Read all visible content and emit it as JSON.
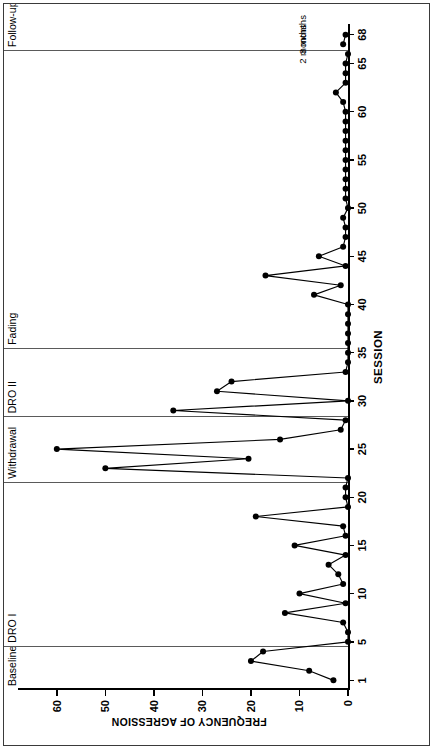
{
  "figure": {
    "kind": "single-case-design-graph",
    "has_outer_border": true,
    "orientation_note": "printed-sideways"
  },
  "chart_data": {
    "type": "line",
    "title": "",
    "xlabel": "SESSION",
    "ylabel": "FREQUENCY OF AGRESSION",
    "xlim": [
      0,
      69
    ],
    "ylim": [
      0,
      68
    ],
    "xticks": [
      1,
      5,
      10,
      15,
      20,
      25,
      30,
      35,
      40,
      45,
      50,
      55,
      60,
      65,
      68
    ],
    "yticks": [
      0,
      10,
      20,
      30,
      40,
      50,
      60
    ],
    "grid": false,
    "legend": "none",
    "marker": "filled-circle",
    "line_color": "#000000",
    "series": [
      {
        "name": "Frequency of aggression",
        "x": [
          1,
          2,
          3,
          4,
          5,
          6,
          7,
          8,
          9,
          10,
          11,
          12,
          13,
          14,
          15,
          16,
          17,
          18,
          19,
          20,
          21,
          22,
          23,
          24,
          25,
          26,
          27,
          28,
          29,
          30,
          31,
          32,
          33,
          34,
          35,
          36,
          37,
          38,
          39,
          40,
          41,
          42,
          43,
          44,
          45,
          46,
          47,
          48,
          49,
          50,
          51,
          52,
          53,
          54,
          55,
          56,
          57,
          58,
          59,
          60,
          61,
          62,
          63,
          64,
          65,
          66,
          67,
          68
        ],
        "y": [
          3,
          8,
          20,
          17.5,
          0,
          0,
          1,
          13,
          0.5,
          10,
          1,
          2,
          4,
          0.5,
          11,
          0.5,
          1,
          19,
          0,
          0.5,
          0.5,
          0,
          50,
          20.5,
          60,
          14,
          1.5,
          0.5,
          36,
          0,
          27,
          24,
          0.5,
          0,
          0,
          0,
          0,
          0,
          0,
          0,
          7,
          1.5,
          17,
          0.5,
          6,
          1,
          0.5,
          0.5,
          1,
          0,
          0.5,
          0.5,
          0.5,
          0.5,
          0.5,
          0.5,
          0.5,
          0.5,
          0.5,
          0.5,
          1,
          2.5,
          0.5,
          0.5,
          0.5,
          0,
          1,
          0.5
        ],
        "break_after_x": [
          66
        ]
      }
    ],
    "phases": [
      {
        "label": "Baseline",
        "x_start": 0.0,
        "x_end": 4.5
      },
      {
        "label": "DRO I",
        "x_start": 4.5,
        "x_end": 21.5
      },
      {
        "label": "Withdrawal",
        "x_start": 21.5,
        "x_end": 28.3
      },
      {
        "label": "DRO II",
        "x_start": 28.3,
        "x_end": 35.4
      },
      {
        "label": "Fading",
        "x_start": 35.4,
        "x_end": 66.3
      },
      {
        "label": "Follow-up",
        "x_start": 66.3,
        "x_end": 69.0
      }
    ],
    "annotations": [
      {
        "text": "2 months",
        "x": 67,
        "y": 9.5
      },
      {
        "text": "3 months",
        "x": 68,
        "y": 9.5
      }
    ]
  }
}
